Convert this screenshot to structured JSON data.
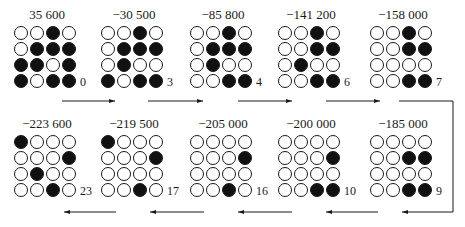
{
  "figure": {
    "colors": {
      "filled": "#111111",
      "empty": "#ffffff",
      "line": "#1a1a1a"
    },
    "panels": [
      {
        "score": "35 600",
        "step": "0",
        "row": 0,
        "col": 0,
        "cells": [
          [
            0,
            0,
            1,
            0
          ],
          [
            0,
            1,
            1,
            1
          ],
          [
            1,
            1,
            0,
            1
          ],
          [
            1,
            0,
            1,
            1
          ]
        ]
      },
      {
        "score": "−30 500",
        "step": "3",
        "row": 0,
        "col": 1,
        "cells": [
          [
            0,
            0,
            1,
            0
          ],
          [
            0,
            1,
            1,
            1
          ],
          [
            0,
            1,
            0,
            0
          ],
          [
            1,
            0,
            1,
            1
          ]
        ]
      },
      {
        "score": "−85 800",
        "step": "4",
        "row": 0,
        "col": 2,
        "cells": [
          [
            0,
            0,
            1,
            0
          ],
          [
            0,
            1,
            1,
            1
          ],
          [
            0,
            1,
            0,
            0
          ],
          [
            0,
            0,
            1,
            1
          ]
        ]
      },
      {
        "score": "−141 200",
        "step": "6",
        "row": 0,
        "col": 3,
        "cells": [
          [
            0,
            0,
            1,
            0
          ],
          [
            0,
            0,
            1,
            1
          ],
          [
            0,
            1,
            0,
            0
          ],
          [
            0,
            0,
            1,
            1
          ]
        ]
      },
      {
        "score": "−158 000",
        "step": "7",
        "row": 0,
        "col": 4,
        "cells": [
          [
            0,
            0,
            1,
            0
          ],
          [
            0,
            0,
            1,
            1
          ],
          [
            0,
            0,
            0,
            0
          ],
          [
            0,
            0,
            1,
            1
          ]
        ]
      },
      {
        "score": "−185 000",
        "step": "9",
        "row": 1,
        "col": 4,
        "cells": [
          [
            0,
            0,
            0,
            0
          ],
          [
            0,
            0,
            1,
            1
          ],
          [
            0,
            0,
            0,
            0
          ],
          [
            0,
            0,
            1,
            1
          ]
        ]
      },
      {
        "score": "−200 000",
        "step": "10",
        "row": 1,
        "col": 3,
        "cells": [
          [
            0,
            0,
            0,
            0
          ],
          [
            0,
            0,
            0,
            1
          ],
          [
            0,
            0,
            0,
            0
          ],
          [
            0,
            0,
            1,
            1
          ]
        ]
      },
      {
        "score": "−205 000",
        "step": "16",
        "row": 1,
        "col": 2,
        "cells": [
          [
            0,
            0,
            0,
            0
          ],
          [
            0,
            0,
            0,
            1
          ],
          [
            0,
            0,
            0,
            0
          ],
          [
            0,
            0,
            1,
            0
          ]
        ]
      },
      {
        "score": "−219 500",
        "step": "17",
        "row": 1,
        "col": 1,
        "cells": [
          [
            1,
            0,
            0,
            0
          ],
          [
            0,
            0,
            0,
            1
          ],
          [
            0,
            0,
            0,
            0
          ],
          [
            0,
            0,
            1,
            0
          ]
        ]
      },
      {
        "score": "−223 600",
        "step": "23",
        "row": 1,
        "col": 0,
        "cells": [
          [
            1,
            0,
            0,
            0
          ],
          [
            0,
            0,
            0,
            1
          ],
          [
            0,
            1,
            0,
            0
          ],
          [
            0,
            0,
            1,
            0
          ]
        ]
      }
    ],
    "arrows": {
      "top": [
        {
          "x1": 62,
          "x2": 115
        },
        {
          "x1": 148,
          "x2": 203
        },
        {
          "x1": 238,
          "x2": 292
        },
        {
          "x1": 326,
          "x2": 380
        }
      ],
      "bracket": {
        "x_start": 399,
        "x_right": 453,
        "y_top": 101,
        "y_bottom": 212,
        "x_end": 402
      },
      "bottom": [
        {
          "x1": 378,
          "x2": 326
        },
        {
          "x1": 292,
          "x2": 238
        },
        {
          "x1": 204,
          "x2": 150
        },
        {
          "x1": 116,
          "x2": 64
        }
      ],
      "top_y": 101,
      "bottom_y": 212
    }
  }
}
